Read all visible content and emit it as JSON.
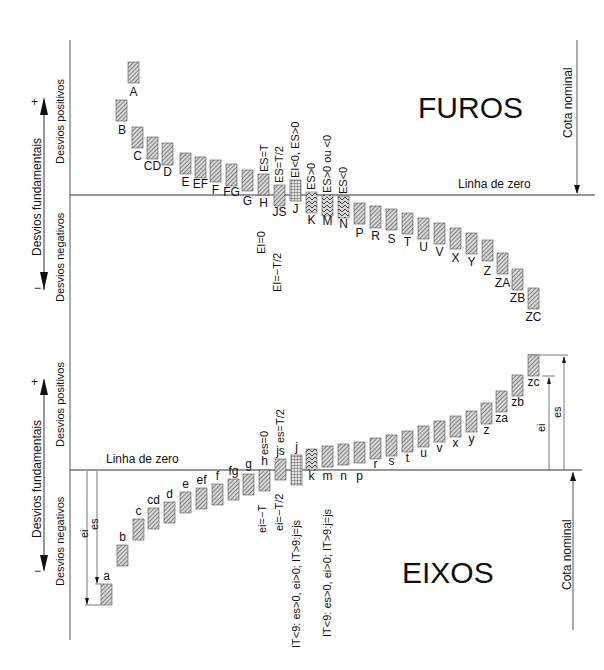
{
  "colors": {
    "line": "#333333",
    "bar_fill": "#bdbdbd",
    "bar_stroke": "#444444",
    "background": "#ffffff"
  },
  "holes": {
    "title": "FUROS",
    "zero_line_label": "Linha de zero",
    "nominal_label": "Cota nominal",
    "axis_label": "Desvios fundamentais",
    "positive_label": "Desvios positivos",
    "negative_label": "Desvios negativos",
    "plus_sign": "+",
    "minus_sign": "−",
    "annotations": {
      "H_top": "ES=T",
      "H_bottom": "EI=0",
      "JS_top": "ES=T/2",
      "JS_bottom": "EI=−T/2",
      "J_top": "EI<0, ES>0",
      "K_top": "ES>0",
      "M_top": "ES>0 ou <0",
      "N_top": "ES<0"
    },
    "bars": [
      {
        "label": "A",
        "x": 128,
        "top": 62,
        "bottom": 83,
        "pattern": "hatch",
        "label_y": 96
      },
      {
        "label": "B",
        "x": 116,
        "top": 100,
        "bottom": 121,
        "pattern": "hatch",
        "label_y": 134,
        "lx": 122
      },
      {
        "label": "C",
        "x": 132,
        "top": 127,
        "bottom": 148,
        "pattern": "hatch",
        "label_y": 160
      },
      {
        "label": "CD",
        "x": 147,
        "top": 137,
        "bottom": 159,
        "pattern": "hatch",
        "label_y": 170
      },
      {
        "label": "D",
        "x": 162,
        "top": 143,
        "bottom": 165,
        "pattern": "hatch",
        "label_y": 176
      },
      {
        "label": "E",
        "x": 180,
        "top": 153,
        "bottom": 174,
        "pattern": "hatch",
        "label_y": 186
      },
      {
        "label": "EF",
        "x": 195,
        "top": 157,
        "bottom": 178,
        "pattern": "hatch",
        "label_y": 188
      },
      {
        "label": "F",
        "x": 210,
        "top": 160,
        "bottom": 182,
        "pattern": "hatch",
        "label_y": 194
      },
      {
        "label": "FG",
        "x": 226,
        "top": 164,
        "bottom": 186,
        "pattern": "hatch",
        "label_y": 196
      },
      {
        "label": "G",
        "x": 242,
        "top": 170,
        "bottom": 191,
        "pattern": "hatch",
        "label_y": 205
      },
      {
        "label": "H",
        "x": 258,
        "top": 174,
        "bottom": 195,
        "pattern": "hatch",
        "label_y": 207
      },
      {
        "label": "JS",
        "x": 274,
        "top": 185,
        "bottom": 206,
        "pattern": "hatch",
        "label_y": 216
      },
      {
        "label": "J",
        "x": 290,
        "top": 180,
        "bottom": 201,
        "pattern": "grid",
        "label_y": 213
      },
      {
        "label": "K",
        "x": 306,
        "top": 192,
        "bottom": 213,
        "pattern": "chevron",
        "label_y": 224
      },
      {
        "label": "M",
        "x": 322,
        "top": 195,
        "bottom": 216,
        "pattern": "chevron",
        "label_y": 225
      },
      {
        "label": "N",
        "x": 338,
        "top": 196,
        "bottom": 218,
        "pattern": "chevron",
        "label_y": 228
      },
      {
        "label": "P",
        "x": 354,
        "top": 203,
        "bottom": 224,
        "pattern": "hatch",
        "label_y": 237
      },
      {
        "label": "R",
        "x": 370,
        "top": 206,
        "bottom": 228,
        "pattern": "hatch",
        "label_y": 240
      },
      {
        "label": "S",
        "x": 386,
        "top": 209,
        "bottom": 230,
        "pattern": "hatch",
        "label_y": 243
      },
      {
        "label": "T",
        "x": 402,
        "top": 213,
        "bottom": 234,
        "pattern": "hatch",
        "label_y": 246
      },
      {
        "label": "U",
        "x": 418,
        "top": 218,
        "bottom": 239,
        "pattern": "hatch",
        "label_y": 251
      },
      {
        "label": "V",
        "x": 434,
        "top": 223,
        "bottom": 244,
        "pattern": "hatch",
        "label_y": 256
      },
      {
        "label": "X",
        "x": 450,
        "top": 228,
        "bottom": 249,
        "pattern": "hatch",
        "label_y": 262
      },
      {
        "label": "Y",
        "x": 466,
        "top": 233,
        "bottom": 254,
        "pattern": "hatch",
        "label_y": 266
      },
      {
        "label": "Z",
        "x": 482,
        "top": 240,
        "bottom": 261,
        "pattern": "hatch",
        "label_y": 275
      },
      {
        "label": "ZA",
        "x": 497,
        "top": 253,
        "bottom": 274,
        "pattern": "hatch",
        "label_y": 287
      },
      {
        "label": "ZB",
        "x": 512,
        "top": 269,
        "bottom": 290,
        "pattern": "hatch",
        "label_y": 302
      },
      {
        "label": "ZC",
        "x": 528,
        "top": 288,
        "bottom": 309,
        "pattern": "hatch",
        "label_y": 321
      }
    ]
  },
  "shafts": {
    "title": "EIXOS",
    "zero_line_label": "Linha de zero",
    "nominal_label": "Cota nominal",
    "axis_label": "Desvios fundamentais",
    "positive_label": "Desvios positivos",
    "negative_label": "Desvios negativos",
    "plus_sign": "+",
    "minus_sign": "−",
    "ei_label": "ei",
    "es_label": "es",
    "annotations": {
      "h_top": "es=0",
      "h_bottom": "ei=−T",
      "js_top": "es=T/2",
      "js_bottom": "ei=−T/2",
      "j_bottom": "IT<9: es>0, ei>0; IT>9:j=js",
      "m_bottom": "IT<9: es>0, ei>0; IT>9:j=js"
    },
    "bars": [
      {
        "label": "a",
        "x": 101,
        "top": 584,
        "bottom": 605,
        "pattern": "hatch",
        "label_y": 580
      },
      {
        "label": "b",
        "x": 117,
        "top": 545,
        "bottom": 566,
        "pattern": "hatch",
        "label_y": 541
      },
      {
        "label": "c",
        "x": 133,
        "top": 519,
        "bottom": 540,
        "pattern": "hatch",
        "label_y": 515
      },
      {
        "label": "cd",
        "x": 148,
        "top": 508,
        "bottom": 529,
        "pattern": "hatch",
        "label_y": 504
      },
      {
        "label": "d",
        "x": 164,
        "top": 502,
        "bottom": 523,
        "pattern": "hatch",
        "label_y": 498
      },
      {
        "label": "e",
        "x": 180,
        "top": 492,
        "bottom": 513,
        "pattern": "hatch",
        "label_y": 488
      },
      {
        "label": "ef",
        "x": 196,
        "top": 488,
        "bottom": 509,
        "pattern": "hatch",
        "label_y": 484
      },
      {
        "label": "f",
        "x": 212,
        "top": 484,
        "bottom": 505,
        "pattern": "hatch",
        "label_y": 480
      },
      {
        "label": "fg",
        "x": 228,
        "top": 479,
        "bottom": 500,
        "pattern": "hatch",
        "label_y": 475
      },
      {
        "label": "g",
        "x": 243,
        "top": 474,
        "bottom": 495,
        "pattern": "hatch",
        "label_y": 468
      },
      {
        "label": "h",
        "x": 259,
        "top": 470,
        "bottom": 491,
        "pattern": "hatch",
        "label_y": 465
      },
      {
        "label": "js",
        "x": 275,
        "top": 459,
        "bottom": 480,
        "pattern": "hatch",
        "label_y": 455
      },
      {
        "label": "j",
        "x": 291,
        "top": 455,
        "bottom": 485,
        "pattern": "grid",
        "label_y": 451
      },
      {
        "label": "k",
        "x": 306,
        "top": 449,
        "bottom": 470,
        "pattern": "chevron",
        "label_y": 480,
        "below": true
      },
      {
        "label": "m",
        "x": 322,
        "top": 446,
        "bottom": 467,
        "pattern": "hatch",
        "label_y": 480,
        "below": true
      },
      {
        "label": "n",
        "x": 338,
        "top": 444,
        "bottom": 465,
        "pattern": "hatch",
        "label_y": 480,
        "below": true
      },
      {
        "label": "p",
        "x": 354,
        "top": 442,
        "bottom": 463,
        "pattern": "hatch",
        "label_y": 480,
        "below": true
      },
      {
        "label": "r",
        "x": 370,
        "top": 438,
        "bottom": 459,
        "pattern": "hatch",
        "label_y": 468,
        "below": true
      },
      {
        "label": "s",
        "x": 386,
        "top": 435,
        "bottom": 456,
        "pattern": "hatch",
        "label_y": 465,
        "below": true
      },
      {
        "label": "t",
        "x": 402,
        "top": 431,
        "bottom": 452,
        "pattern": "hatch",
        "label_y": 462,
        "below": true
      },
      {
        "label": "u",
        "x": 418,
        "top": 426,
        "bottom": 447,
        "pattern": "hatch",
        "label_y": 457,
        "below": true
      },
      {
        "label": "v",
        "x": 434,
        "top": 421,
        "bottom": 442,
        "pattern": "hatch",
        "label_y": 452,
        "below": true
      },
      {
        "label": "x",
        "x": 450,
        "top": 416,
        "bottom": 437,
        "pattern": "hatch",
        "label_y": 447,
        "below": true
      },
      {
        "label": "y",
        "x": 466,
        "top": 411,
        "bottom": 432,
        "pattern": "hatch",
        "label_y": 443,
        "below": true
      },
      {
        "label": "z",
        "x": 481,
        "top": 403,
        "bottom": 424,
        "pattern": "hatch",
        "label_y": 434,
        "below": true
      },
      {
        "label": "za",
        "x": 496,
        "top": 391,
        "bottom": 412,
        "pattern": "hatch",
        "label_y": 422,
        "below": true
      },
      {
        "label": "zb",
        "x": 512,
        "top": 375,
        "bottom": 396,
        "pattern": "hatch",
        "label_y": 406,
        "below": true
      },
      {
        "label": "zc",
        "x": 528,
        "top": 355,
        "bottom": 376,
        "pattern": "hatch",
        "label_y": 386,
        "below": true
      }
    ]
  }
}
